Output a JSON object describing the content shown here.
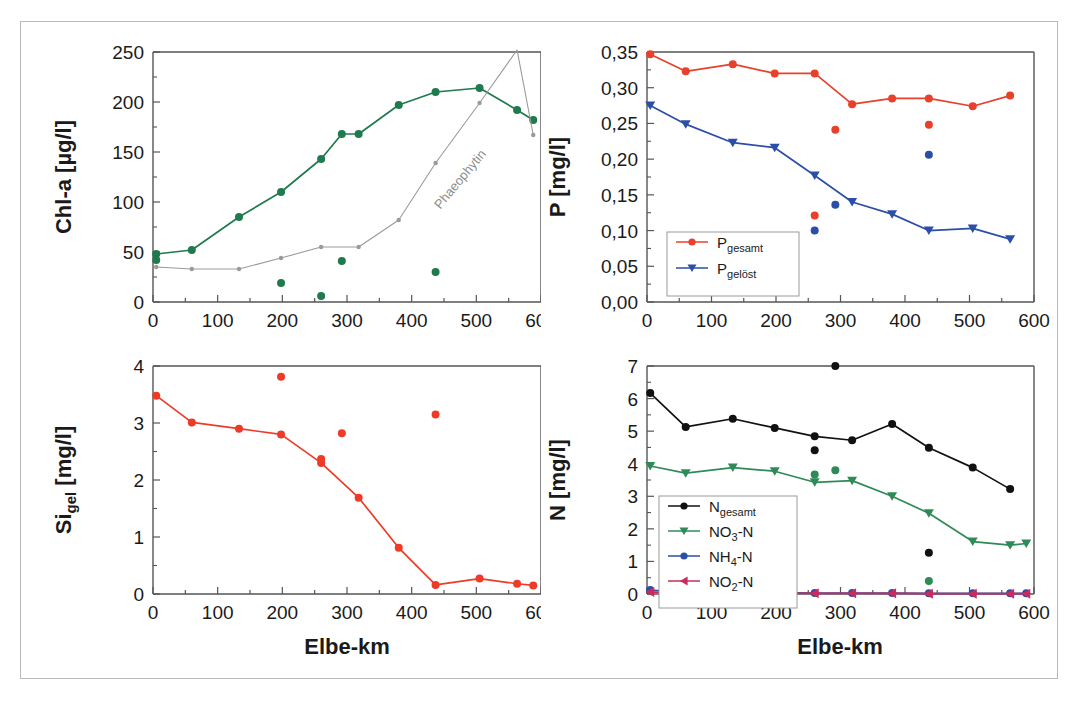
{
  "figure": {
    "border_color": "#b9b9b9",
    "background": "#ffffff"
  },
  "axis": {
    "xlabel": "Elbe-km",
    "x_ticks": [
      "0",
      "100",
      "200",
      "300",
      "400",
      "500",
      "600"
    ],
    "x_min": 0,
    "x_max": 600
  },
  "panels": {
    "chla": {
      "ylabel_main": "Chl-a [µg/l]",
      "y_ticks": [
        "0",
        "50",
        "100",
        "150",
        "200",
        "250"
      ],
      "y_min": 0,
      "y_max": 250,
      "annotation": "Phaeophytin"
    },
    "phosphorus": {
      "ylabel_main": "P [mg/l]",
      "y_ticks": [
        "0,00",
        "0,05",
        "0,10",
        "0,15",
        "0,20",
        "0,25",
        "0,30",
        "0,35"
      ],
      "y_min": 0.0,
      "y_max": 0.35,
      "legend": [
        {
          "label_main": "P",
          "label_sub": "gesamt",
          "color": "#e8402a",
          "marker": "circle"
        },
        {
          "label_main": "P",
          "label_sub": "gelöst",
          "color": "#2b4ea8",
          "marker": "triangle-down"
        }
      ]
    },
    "silicon": {
      "ylabel_main": "Si",
      "ylabel_sub": "gel",
      "ylabel_tail": " [mg/l]",
      "y_ticks": [
        "0",
        "1",
        "2",
        "3",
        "4"
      ],
      "y_min": 0,
      "y_max": 4,
      "xlabel": "Elbe-km"
    },
    "nitrogen": {
      "ylabel_main": "N [mg/l]",
      "y_ticks": [
        "0",
        "1",
        "2",
        "3",
        "4",
        "5",
        "6",
        "7"
      ],
      "y_min": 0,
      "y_max": 7,
      "xlabel": "Elbe-km",
      "legend": [
        {
          "label_main": "N",
          "label_sub": "gesamt",
          "label_tail": "",
          "color": "#111111",
          "marker": "circle"
        },
        {
          "label_main": "NO",
          "label_sub": "3",
          "label_tail": "-N",
          "color": "#2e8b57",
          "marker": "triangle-down"
        },
        {
          "label_main": "NH",
          "label_sub": "4",
          "label_tail": "-N",
          "color": "#2b4ea8",
          "marker": "circle"
        },
        {
          "label_main": "NO",
          "label_sub": "2",
          "label_tail": "-N",
          "color": "#cc2a5a",
          "marker": "triangle-left"
        }
      ]
    }
  },
  "chart_data": [
    {
      "type": "line",
      "id": "chla",
      "title": "",
      "xlabel": "Elbe-km",
      "ylabel": "Chl-a [µg/l]",
      "xlim": [
        0,
        600
      ],
      "ylim": [
        0,
        250
      ],
      "grid": false,
      "legend_position": "none",
      "annotations": [
        {
          "text": "Phaeophytin",
          "x": 480,
          "y": 120,
          "rotation": -50,
          "color": "#8a8a8a"
        }
      ],
      "series": [
        {
          "name": "Chl-a",
          "color": "#1f7a4d",
          "marker": "circle",
          "connected": true,
          "x": [
            5,
            60,
            133,
            198,
            260,
            292,
            318,
            380,
            437,
            505,
            563,
            588
          ],
          "y": [
            48,
            52,
            85,
            110,
            143,
            168,
            168,
            197,
            210,
            214,
            192,
            182
          ]
        },
        {
          "name": "Phaeophytin",
          "color": "#9a9a9a",
          "marker": "small-circle",
          "connected": true,
          "x": [
            5,
            60,
            133,
            198,
            260,
            318,
            380,
            437,
            505,
            563,
            588
          ],
          "y": [
            35,
            33,
            33,
            44,
            55,
            55,
            82,
            139,
            199,
            252,
            167
          ]
        },
        {
          "name": "Chl-a Einzelwerte",
          "color": "#1f7a4d",
          "marker": "circle",
          "connected": false,
          "x": [
            5,
            198,
            260,
            292,
            437
          ],
          "y": [
            42,
            19,
            6,
            41,
            30
          ]
        }
      ]
    },
    {
      "type": "line",
      "id": "phosphorus",
      "title": "",
      "xlabel": "Elbe-km",
      "ylabel": "P [mg/l]",
      "xlim": [
        0,
        600
      ],
      "ylim": [
        0.0,
        0.35
      ],
      "grid": false,
      "legend_position": "lower-left",
      "series": [
        {
          "name": "P gesamt",
          "color": "#e8402a",
          "marker": "circle",
          "connected": true,
          "x": [
            5,
            60,
            133,
            198,
            260,
            318,
            380,
            437,
            505,
            563
          ],
          "y": [
            0.347,
            0.323,
            0.333,
            0.32,
            0.32,
            0.277,
            0.285,
            0.285,
            0.274,
            0.289
          ]
        },
        {
          "name": "P gelöst",
          "color": "#2b4ea8",
          "marker": "triangle-down",
          "connected": true,
          "x": [
            5,
            60,
            133,
            198,
            260,
            318,
            380,
            437,
            505,
            563
          ],
          "y": [
            0.275,
            0.249,
            0.223,
            0.216,
            0.177,
            0.14,
            0.123,
            0.1,
            0.103,
            0.088
          ]
        },
        {
          "name": "P gesamt Einzelwerte",
          "color": "#e8402a",
          "marker": "circle",
          "connected": false,
          "x": [
            198,
            260,
            292,
            437
          ],
          "y": [
            0.027,
            0.121,
            0.241,
            0.248
          ]
        },
        {
          "name": "P gelöst Einzelwerte",
          "color": "#2b4ea8",
          "marker": "circle",
          "connected": false,
          "x": [
            198,
            260,
            292,
            437
          ],
          "y": [
            0.023,
            0.1,
            0.136,
            0.206
          ]
        }
      ]
    },
    {
      "type": "line",
      "id": "silicon",
      "title": "",
      "xlabel": "Elbe-km",
      "ylabel": "Si_gel [mg/l]",
      "xlim": [
        0,
        600
      ],
      "ylim": [
        0,
        4
      ],
      "grid": false,
      "legend_position": "none",
      "series": [
        {
          "name": "Si gelöst",
          "color": "#ee3b28",
          "marker": "circle",
          "connected": true,
          "x": [
            5,
            60,
            133,
            198,
            260,
            318,
            380,
            437,
            505,
            563,
            588
          ],
          "y": [
            3.48,
            3.01,
            2.9,
            2.8,
            2.3,
            1.69,
            0.81,
            0.16,
            0.27,
            0.18,
            0.15
          ]
        },
        {
          "name": "Si Einzelwerte",
          "color": "#ee3b28",
          "marker": "circle",
          "connected": false,
          "x": [
            198,
            260,
            292,
            437
          ],
          "y": [
            3.81,
            2.37,
            2.82,
            3.15
          ]
        }
      ]
    },
    {
      "type": "line",
      "id": "nitrogen",
      "title": "",
      "xlabel": "Elbe-km",
      "ylabel": "N [mg/l]",
      "xlim": [
        0,
        600
      ],
      "ylim": [
        0,
        7
      ],
      "grid": false,
      "legend_position": "lower-left",
      "series": [
        {
          "name": "N gesamt",
          "color": "#111111",
          "marker": "circle",
          "connected": true,
          "x": [
            5,
            60,
            133,
            198,
            260,
            318,
            380,
            437,
            505,
            563
          ],
          "y": [
            6.17,
            5.13,
            5.38,
            5.1,
            4.84,
            4.72,
            5.22,
            4.49,
            3.88,
            3.22
          ]
        },
        {
          "name": "NO3-N",
          "color": "#2e8b57",
          "marker": "triangle-down",
          "connected": true,
          "x": [
            5,
            60,
            133,
            198,
            260,
            318,
            380,
            437,
            505,
            563,
            588
          ],
          "y": [
            3.93,
            3.71,
            3.88,
            3.77,
            3.43,
            3.48,
            3.0,
            2.48,
            1.61,
            1.5,
            1.55
          ]
        },
        {
          "name": "NH4-N",
          "color": "#2b4ea8",
          "marker": "circle",
          "connected": true,
          "x": [
            5,
            60,
            133,
            198,
            260,
            318,
            380,
            437,
            505,
            563,
            588
          ],
          "y": [
            0.12,
            0.04,
            0.1,
            0.04,
            0.03,
            0.03,
            0.03,
            0.02,
            0.02,
            0.02,
            0.02
          ]
        },
        {
          "name": "NO2-N",
          "color": "#cc2a5a",
          "marker": "triangle-left",
          "connected": true,
          "x": [
            5,
            60,
            133,
            198,
            260,
            318,
            380,
            437,
            505,
            563,
            588
          ],
          "y": [
            0.06,
            0.03,
            0.05,
            0.03,
            0.02,
            0.02,
            0.02,
            0.01,
            0.01,
            0.01,
            0.01
          ]
        },
        {
          "name": "N gesamt Einzelwerte",
          "color": "#111111",
          "marker": "circle",
          "connected": false,
          "x": [
            198,
            260,
            292,
            437
          ],
          "y": [
            0.82,
            4.41,
            7.0,
            1.27
          ]
        },
        {
          "name": "NO3-N Einzelwerte",
          "color": "#2e8b57",
          "marker": "circle",
          "connected": false,
          "x": [
            198,
            260,
            292,
            437
          ],
          "y": [
            1.12,
            3.67,
            3.8,
            0.4
          ]
        }
      ]
    }
  ]
}
